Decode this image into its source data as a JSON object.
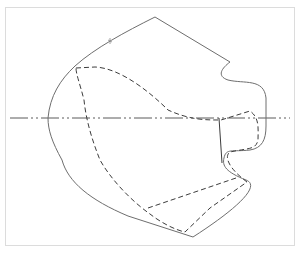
{
  "diagram": {
    "title": "Sleeve pattern drawing",
    "colors": {
      "background": "#ffffff",
      "frame": "#dcdcdc",
      "outline": "#6e6e6e",
      "dashed": "#3c3c3c",
      "center_line": "#5a5a5a"
    },
    "layers": [
      {
        "name": "outer-outline",
        "style": "solid"
      },
      {
        "name": "inner-outline",
        "style": "dashed"
      },
      {
        "name": "center-line",
        "style": "dash-dot-dot"
      }
    ]
  }
}
